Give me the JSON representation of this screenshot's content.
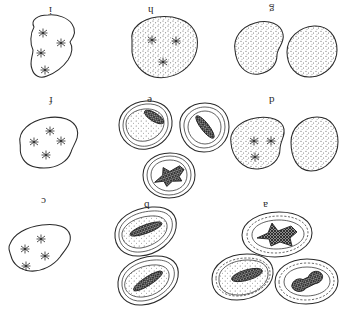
{
  "figure": {
    "orientation": "rotated-180",
    "background_color": "#ffffff",
    "ink_color": "#2a2a2a",
    "panel_count": 9,
    "labels": [
      "a",
      "b",
      "c",
      "d",
      "e",
      "f",
      "g",
      "h",
      "i"
    ]
  },
  "panels": [
    {
      "id": "panel-i",
      "label": "i",
      "label_x": 52,
      "label_y": 11,
      "row": "top",
      "column": "left",
      "cells": 1,
      "outline_style": "plain",
      "stippled": false,
      "chromosome_figures": 4,
      "chromosome_style": "star-cluster",
      "description": "single irregular cell outline containing four dispersed star-like chromosome clusters"
    },
    {
      "id": "panel-h",
      "label": "h",
      "label_x": 151,
      "label_y": 11,
      "row": "top",
      "column": "center",
      "cells": 1,
      "outline_style": "plain",
      "stippled": true,
      "chromosome_figures": 3,
      "chromosome_style": "star-cluster",
      "description": "single stippled rounded cell with three star-like chromosome clusters"
    },
    {
      "id": "panel-g",
      "label": "g",
      "label_x": 272,
      "label_y": 11,
      "row": "top",
      "column": "right",
      "cells": 2,
      "outline_style": "plain",
      "stippled": true,
      "chromosome_figures": 0,
      "chromosome_style": "none",
      "description": "two stippled daughter cells with no visible chromosomes"
    },
    {
      "id": "panel-f",
      "label": "f",
      "label_x": 52,
      "label_y": 100,
      "row": "middle",
      "column": "left",
      "cells": 1,
      "outline_style": "plain",
      "stippled": false,
      "chromosome_figures": 4,
      "chromosome_style": "star-cluster",
      "description": "single unshaded cell outline with four star-like chromosome clusters"
    },
    {
      "id": "panel-e",
      "label": "e",
      "label_x": 149,
      "label_y": 98,
      "row": "middle",
      "column": "center",
      "cells": 3,
      "outline_style": "double",
      "stippled": true,
      "chromosome_figures": 3,
      "chromosome_style": "cross-hatched-mass",
      "description": "three double-walled cells each enclosing a dark cross-hatched chromosome mass"
    },
    {
      "id": "panel-d",
      "label": "d",
      "label_x": 272,
      "label_y": 100,
      "row": "middle",
      "column": "right",
      "cells": 2,
      "outline_style": "plain",
      "stippled": true,
      "chromosome_figures": 3,
      "chromosome_style": "star-cluster",
      "description": "two stippled cells, the left with three star-like chromosome clusters"
    },
    {
      "id": "panel-c",
      "label": "c",
      "label_x": 44,
      "label_y": 202,
      "row": "bottom",
      "column": "left",
      "cells": 1,
      "outline_style": "plain",
      "stippled": false,
      "chromosome_figures": 4,
      "chromosome_style": "star-cluster",
      "description": "single unshaded cell outline with four star-like chromosome clusters"
    },
    {
      "id": "panel-b",
      "label": "b",
      "label_x": 145,
      "label_y": 205,
      "row": "bottom",
      "column": "center",
      "cells": 2,
      "outline_style": "double",
      "stippled": true,
      "chromosome_figures": 2,
      "chromosome_style": "cross-hatched-mass",
      "description": "two double-walled cells each with an elongated dark cross-hatched chromosome mass"
    },
    {
      "id": "panel-a",
      "label": "a",
      "label_x": 265,
      "label_y": 205,
      "row": "bottom",
      "column": "right",
      "cells": 3,
      "outline_style": "double-dashed",
      "stippled": true,
      "chromosome_figures": 3,
      "chromosome_style": "cross-hatched-mass",
      "description": "three dashed double-walled cells, the upper with a star-shaped cross-hatched mass"
    }
  ]
}
